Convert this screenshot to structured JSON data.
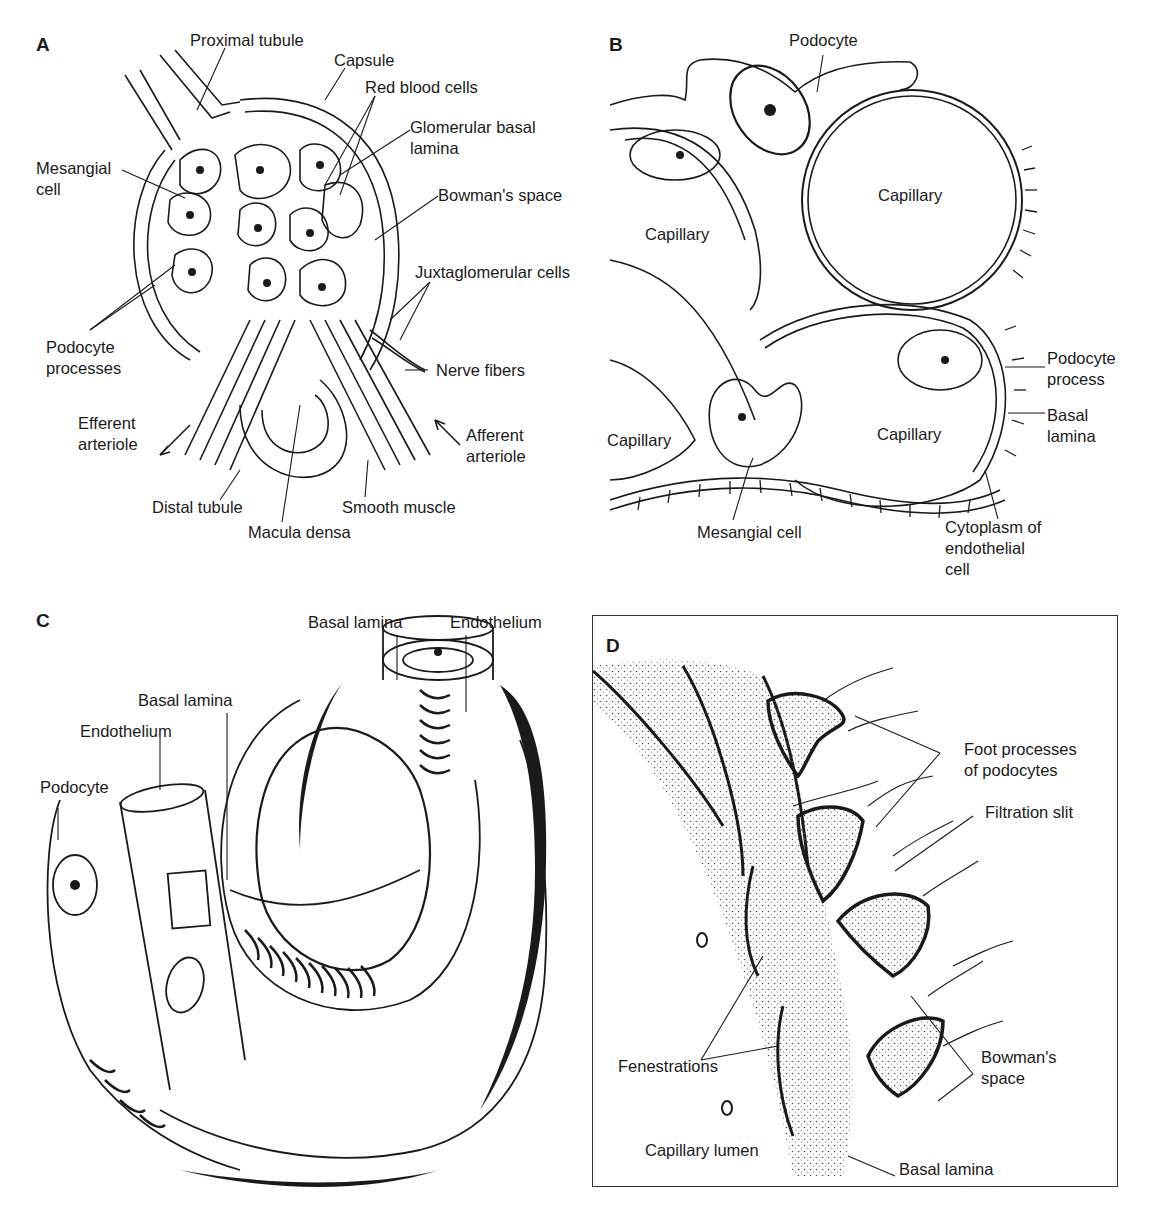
{
  "figure": {
    "panels": [
      {
        "id": "A",
        "letter": "A",
        "labels": {
          "proximal_tubule": "Proximal tubule",
          "capsule": "Capsule",
          "red_blood_cells": "Red blood cells",
          "glomerular_basal_lamina": "Glomerular basal\nlamina",
          "mesangial_cell": "Mesangial\ncell",
          "bowmans_space": "Bowman's space",
          "juxtaglomerular_cells": "Juxtaglomerular cells",
          "podocyte_processes": "Podocyte\nprocesses",
          "nerve_fibers": "Nerve fibers",
          "efferent_arteriole": "Efferent\narteriole",
          "afferent_arteriole": "Afferent\narteriole",
          "distal_tubule": "Distal tubule",
          "smooth_muscle": "Smooth muscle",
          "macula_densa": "Macula densa"
        }
      },
      {
        "id": "B",
        "letter": "B",
        "labels": {
          "podocyte": "Podocyte",
          "capillary_top_left": "Capillary",
          "capillary_top_right": "Capillary",
          "capillary_bottom_left": "Capillary",
          "capillary_bottom_right": "Capillary",
          "podocyte_process": "Podocyte\nprocess",
          "basal_lamina": "Basal\nlamina",
          "mesangial_cell": "Mesangial cell",
          "cytoplasm_endothelial": "Cytoplasm of\nendothelial\ncell"
        }
      },
      {
        "id": "C",
        "letter": "C",
        "labels": {
          "basal_lamina_top": "Basal lamina",
          "endothelium_top": "Endothelium",
          "basal_lamina_left": "Basal lamina",
          "endothelium_left": "Endothelium",
          "podocyte": "Podocyte"
        }
      },
      {
        "id": "D",
        "letter": "D",
        "labels": {
          "foot_processes": "Foot processes\nof podocytes",
          "filtration_slit": "Filtration slit",
          "fenestrations": "Fenestrations",
          "bowmans_space": "Bowman's\nspace",
          "capillary_lumen": "Capillary lumen",
          "basal_lamina": "Basal lamina"
        }
      }
    ],
    "colors": {
      "ink": "#1a1a1a",
      "paper": "#ffffff",
      "stipple": "#555555"
    }
  }
}
